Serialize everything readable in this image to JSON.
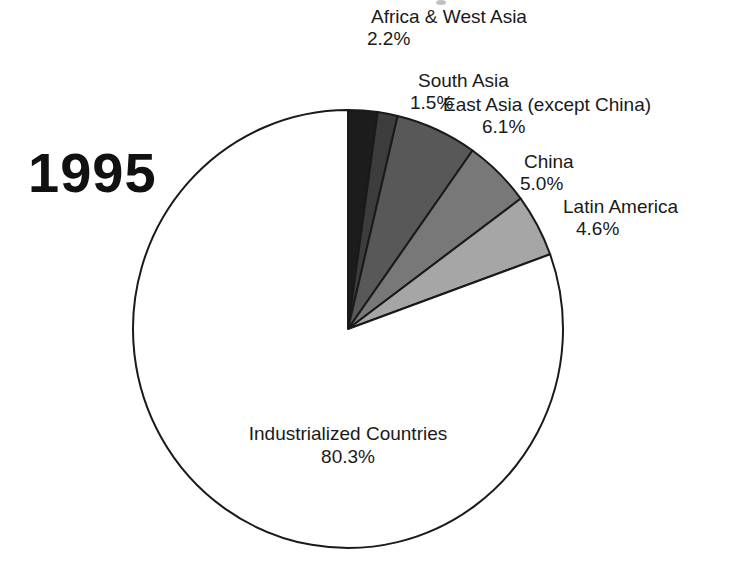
{
  "year": "1995",
  "chart_data": {
    "type": "pie",
    "title": "",
    "subtitle": "1995",
    "categories": [
      "Africa & West Asia",
      "South Asia",
      "East Asia (except China)",
      "China",
      "Latin America",
      "Industrialized Countries"
    ],
    "values": [
      2.2,
      1.5,
      6.1,
      5.0,
      4.6,
      80.3
    ],
    "value_labels": [
      "2.2%",
      "1.5%",
      "6.1%",
      "5.0%",
      "4.6%",
      "80.3%"
    ],
    "units": "percent",
    "start_angle_deg": 0,
    "direction": "clockwise",
    "legend": "none",
    "labels_position": "callout",
    "slice_colors": [
      "#1c1c1c",
      "#3d3d3d",
      "#585858",
      "#787878",
      "#a6a6a6",
      "#ffffff"
    ],
    "stroke_color": "#1a1a1a",
    "slices": [
      {
        "name": "Africa & West Asia",
        "value": 2.2,
        "label": "2.2%",
        "color": "#1c1c1c"
      },
      {
        "name": "South Asia",
        "value": 1.5,
        "label": "1.5%",
        "color": "#3d3d3d"
      },
      {
        "name": "East Asia (except China)",
        "value": 6.1,
        "label": "6.1%",
        "color": "#585858"
      },
      {
        "name": "China",
        "value": 5.0,
        "label": "5.0%",
        "color": "#787878"
      },
      {
        "name": "Latin America",
        "value": 4.6,
        "label": "4.6%",
        "color": "#a6a6a6"
      },
      {
        "name": "Industrialized Countries",
        "value": 80.3,
        "label": "80.3%",
        "color": "#ffffff"
      }
    ]
  },
  "callouts": {
    "africa": {
      "name": "Africa & West Asia",
      "pct": "2.2%"
    },
    "south": {
      "name": "South Asia",
      "pct": "1.5%"
    },
    "easta": {
      "name": "East Asia (except China)",
      "pct": "6.1%"
    },
    "china": {
      "name": "China",
      "pct": "5.0%"
    },
    "latin": {
      "name": "Latin America",
      "pct": "4.6%"
    },
    "inner": {
      "name": "Industrialized Countries",
      "pct": "80.3%"
    }
  }
}
